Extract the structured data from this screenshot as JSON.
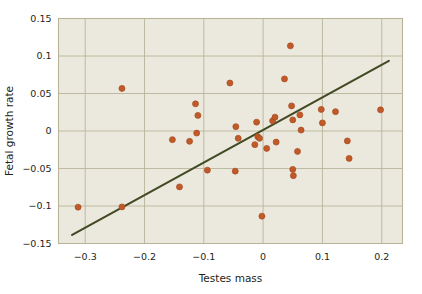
{
  "chart_data": {
    "type": "scatter",
    "title": "",
    "xlabel": "Testes mass",
    "ylabel": "Fetal growth rate",
    "xlim": [
      -0.345,
      0.235
    ],
    "ylim": [
      -0.15,
      0.15
    ],
    "xticks": [
      -0.3,
      -0.2,
      -0.1,
      0,
      0.1,
      0.2
    ],
    "xtick_labels": [
      "−0.3",
      "−0.2",
      "−0.1",
      "0",
      "0.1",
      "0.2"
    ],
    "yticks": [
      -0.15,
      -0.1,
      -0.05,
      0,
      0.05,
      0.1,
      0.15
    ],
    "ytick_labels": [
      "−0.15",
      "−0.1",
      "−0.05",
      "0",
      "0.05",
      "0.1",
      "0.15"
    ],
    "grid": true,
    "legend": null,
    "marker_color": "#c05a28",
    "marker_edge_color": "#a84a20",
    "marker_size": 4.2,
    "plot_background": "#ebe9de",
    "grid_color": "#b9b49a",
    "border_color": "#b9b49a",
    "trendline": {
      "label": "",
      "color": "#414a22",
      "width": 2.1,
      "x_start": -0.322,
      "y_start": -0.1385,
      "x_end": 0.212,
      "y_end": 0.0935
    },
    "points": [
      {
        "x": -0.312,
        "y": -0.1015
      },
      {
        "x": -0.238,
        "y": -0.1012
      },
      {
        "x": -0.238,
        "y": 0.0568
      },
      {
        "x": -0.153,
        "y": -0.0115
      },
      {
        "x": -0.141,
        "y": -0.0745
      },
      {
        "x": -0.124,
        "y": -0.0138
      },
      {
        "x": -0.114,
        "y": 0.0362
      },
      {
        "x": -0.112,
        "y": -0.0028
      },
      {
        "x": -0.11,
        "y": 0.0208
      },
      {
        "x": -0.094,
        "y": -0.0522
      },
      {
        "x": -0.056,
        "y": 0.064
      },
      {
        "x": -0.047,
        "y": -0.0535
      },
      {
        "x": -0.046,
        "y": 0.0058
      },
      {
        "x": -0.042,
        "y": -0.0098
      },
      {
        "x": -0.014,
        "y": -0.0182
      },
      {
        "x": -0.011,
        "y": 0.0118
      },
      {
        "x": -0.009,
        "y": -0.0075
      },
      {
        "x": -0.006,
        "y": -0.0098
      },
      {
        "x": -0.002,
        "y": -0.1135
      },
      {
        "x": 0.006,
        "y": -0.0232
      },
      {
        "x": 0.016,
        "y": 0.0135
      },
      {
        "x": 0.02,
        "y": 0.0185
      },
      {
        "x": 0.022,
        "y": -0.0148
      },
      {
        "x": 0.036,
        "y": 0.0695
      },
      {
        "x": 0.046,
        "y": 0.1135
      },
      {
        "x": 0.048,
        "y": 0.0335
      },
      {
        "x": 0.05,
        "y": 0.0148
      },
      {
        "x": 0.05,
        "y": -0.0512
      },
      {
        "x": 0.051,
        "y": -0.0595
      },
      {
        "x": 0.058,
        "y": -0.0272
      },
      {
        "x": 0.062,
        "y": 0.0215
      },
      {
        "x": 0.064,
        "y": 0.0012
      },
      {
        "x": 0.098,
        "y": 0.0288
      },
      {
        "x": 0.1,
        "y": 0.0108
      },
      {
        "x": 0.122,
        "y": 0.0258
      },
      {
        "x": 0.142,
        "y": -0.0132
      },
      {
        "x": 0.145,
        "y": -0.0365
      },
      {
        "x": 0.198,
        "y": 0.0282
      }
    ]
  }
}
